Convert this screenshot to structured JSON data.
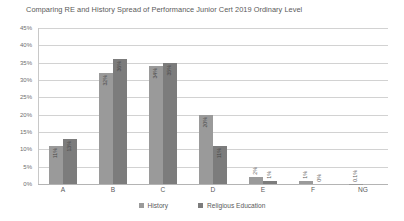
{
  "chart_data": {
    "type": "bar",
    "title": "Comparing RE and History Spread of Performance Junior Cert 2019 Ordinary Level",
    "xlabel": "",
    "ylabel": "",
    "ylim": [
      0,
      45
    ],
    "ytick_labels": [
      "45%",
      "40%",
      "35%",
      "30%",
      "25%",
      "20%",
      "15%",
      "10%",
      "5%",
      "0%"
    ],
    "ytick_values": [
      45,
      40,
      35,
      30,
      25,
      20,
      15,
      10,
      5,
      0
    ],
    "grid": true,
    "legend_position": "bottom",
    "categories": [
      "A",
      "B",
      "C",
      "D",
      "E",
      "F",
      "NG"
    ],
    "series": [
      {
        "name": "History",
        "color": "#9a9a9a",
        "values": [
          11,
          32,
          34,
          20,
          2,
          1,
          0.1
        ],
        "labels": [
          "11%",
          "32%",
          "34%",
          "20%",
          "2%",
          "1%",
          "0.1%"
        ]
      },
      {
        "name": "Religious Education",
        "color": "#7c7c7c",
        "values": [
          13,
          36,
          35,
          11,
          1,
          0,
          0
        ],
        "labels": [
          "13%",
          "36%",
          "35%",
          "11%",
          "1%",
          "0%",
          ""
        ]
      }
    ]
  },
  "legend": {
    "items": [
      {
        "label": "History",
        "swatch": "history"
      },
      {
        "label": "Religious Education",
        "swatch": "re"
      }
    ]
  }
}
